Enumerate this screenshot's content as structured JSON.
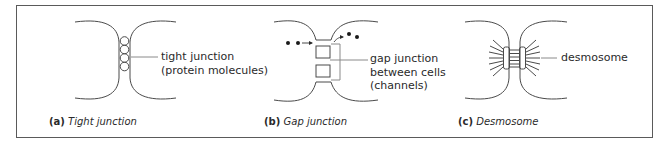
{
  "figure": {
    "panels": [
      {
        "id": "a",
        "label_lines": [
          "tight junction",
          "(protein molecules)"
        ],
        "caption_key": "(a)",
        "caption_title": "Tight junction"
      },
      {
        "id": "b",
        "label_lines": [
          "gap junction",
          "between cells",
          "(channels)"
        ],
        "caption_key": "(b)",
        "caption_title": "Gap junction"
      },
      {
        "id": "c",
        "label_lines": [
          "desmosome"
        ],
        "caption_key": "(c)",
        "caption_title": "Desmosome"
      }
    ],
    "colors": {
      "stroke": "#4a4a4a",
      "frame": "#5a5a5a",
      "leader": "#8a8a8a",
      "text": "#2a2a2a"
    }
  }
}
